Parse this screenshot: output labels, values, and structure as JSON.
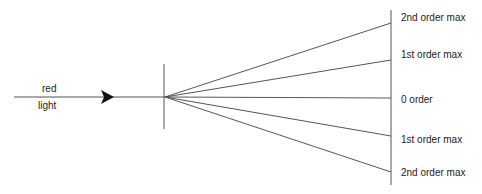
{
  "diagram": {
    "incident_label": {
      "line1": "red",
      "line2": "light"
    },
    "stroke_color": "#555555",
    "labels": [
      {
        "text": "2nd order max",
        "y": 23
      },
      {
        "text": "1st order max",
        "y": 60
      },
      {
        "text": "0 order",
        "y": 98
      },
      {
        "text": "1st order max",
        "y": 136
      },
      {
        "text": "2nd order max",
        "y": 172
      }
    ]
  }
}
